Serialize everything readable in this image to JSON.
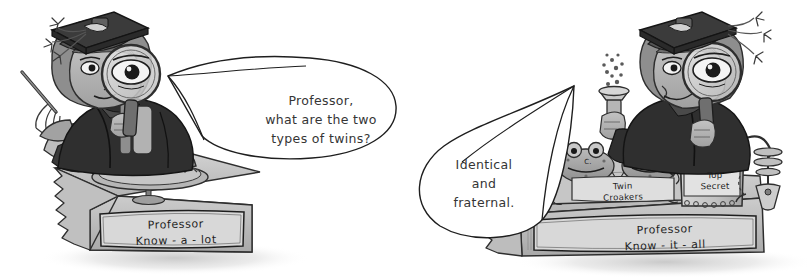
{
  "illustration": {
    "title": "Professor Know-a-lot and Professor Know-it-all twins cartoon",
    "style": "grayscale hand-drawn cartoon, two panels",
    "background_color": "#ffffff",
    "ink_color": "#2b2b2b",
    "grey_mid": "#9a9a9a",
    "grey_dark": "#4a4a4a",
    "grey_light": "#cfcfcf"
  },
  "panels": {
    "left": {
      "name": "Professor Know-a-lot panel",
      "speech_bubble": {
        "text": "Professor,\nwhat are the two\ntypes of twins?",
        "tail_direction": "left"
      },
      "plinth_label": "Professor\nKnow - a - lot",
      "character": {
        "name": "Professor Know-a-lot",
        "facing": "right",
        "props": [
          "mortarboard-cap",
          "magnifying-glass",
          "whisk",
          "rolling-pin",
          "pie-on-stand"
        ]
      }
    },
    "right": {
      "name": "Professor Know-it-all panel",
      "speech_bubble": {
        "text": "Identical\nand\nfraternal.",
        "tail_direction": "right"
      },
      "plinth_label": "Professor\nKnow - it - all",
      "character": {
        "name": "Professor Know-it-all",
        "facing": "left",
        "props": [
          "mortarboard-cap",
          "magnifying-glass",
          "bubbling-flask",
          "twin-frogs",
          "top-secret-jar",
          "lab-tap"
        ]
      },
      "tank_label": "Twin\nCroakers",
      "jar_label": "Top\nSecret",
      "frog_mark": "C."
    }
  }
}
